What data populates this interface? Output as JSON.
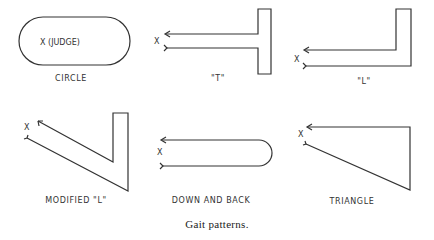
{
  "caption": "Gait patterns.",
  "judge_mark": "X",
  "patterns": [
    {
      "id": "circle",
      "label": "CIRCLE",
      "inner_text": "X (JUDGE)"
    },
    {
      "id": "t",
      "label": "\"T\""
    },
    {
      "id": "l",
      "label": "\"L\""
    },
    {
      "id": "modified-l",
      "label": "MODIFIED \"L\""
    },
    {
      "id": "down-and-back",
      "label": "DOWN AND BACK"
    },
    {
      "id": "triangle",
      "label": "TRIANGLE"
    }
  ],
  "colors": {
    "line": "#333333",
    "background": "#ffffff"
  }
}
